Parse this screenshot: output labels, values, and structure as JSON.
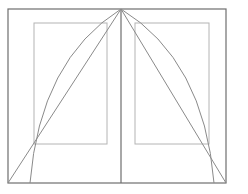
{
  "diagram": {
    "canvas": {
      "width": 248,
      "height": 194,
      "background": "#ffffff"
    },
    "colors": {
      "outer": "#6e6e6e",
      "inner": "#b4b4b4",
      "construction": "#8a8a8a"
    },
    "outer_frame": {
      "x1": 8,
      "y1": 9,
      "x2": 226,
      "y2": 183
    },
    "spine_x": 121,
    "apex": {
      "x": 121,
      "y": 9
    },
    "left_text_block": {
      "x1": 34,
      "y1": 23,
      "x2": 107,
      "y2": 144
    },
    "right_text_block": {
      "x1": 135,
      "y1": 23,
      "x2": 209,
      "y2": 144
    },
    "left_diagonal_end": {
      "x": 8,
      "y": 183
    },
    "right_diagonal_end": {
      "x": 226,
      "y": 183
    },
    "left_arc_end": {
      "x": 30,
      "y": 183
    },
    "right_arc_end": {
      "x": 214,
      "y": 183
    }
  }
}
